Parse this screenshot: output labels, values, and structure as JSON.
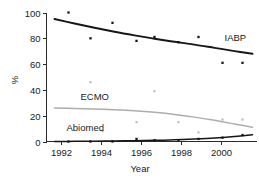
{
  "chart_data": {
    "type": "scatter",
    "title": "",
    "xlabel": "Year",
    "ylabel": "%",
    "xlim": [
      1991.3,
      2001.8
    ],
    "ylim": [
      0,
      100
    ],
    "xticks": [
      1992,
      1994,
      1996,
      1998,
      2000
    ],
    "yticks": [
      0,
      20,
      40,
      60,
      80,
      100
    ],
    "grid": false,
    "legend_position": "inline-annotation",
    "series": [
      {
        "name": "IABP",
        "color": "#161616",
        "marker": "square",
        "x": [
          1992.4,
          1993.5,
          1994.6,
          1995.8,
          1996.7,
          1997.9,
          1998.9,
          2000.1,
          2001.1
        ],
        "values": [
          100,
          80,
          92,
          78,
          81,
          77,
          81,
          61,
          61
        ],
        "fit_x": [
          1991.7,
          1992.7,
          1993.7,
          1994.7,
          1995.7,
          1996.7,
          1997.7,
          1998.7,
          1999.7,
          2000.7,
          2001.6
        ],
        "fit_values": [
          95,
          91.5,
          88.2,
          85.1,
          82.3,
          79.7,
          77.3,
          75.1,
          72.6,
          70.1,
          68
        ]
      },
      {
        "name": "ECMO",
        "color": "#b4b4b4",
        "marker": "square",
        "x": [
          1993.5,
          1994.1,
          1995.8,
          1996.7,
          1997.9,
          1998.9,
          2000.1,
          2001.1
        ],
        "values": [
          46,
          8,
          15,
          39,
          15,
          7,
          17,
          17
        ],
        "fit_x": [
          1991.7,
          1992.7,
          1993.7,
          1994.7,
          1995.7,
          1996.7,
          1997.7,
          1998.7,
          1999.7,
          2000.7,
          2001.6
        ],
        "fit_values": [
          26,
          25.6,
          25.2,
          24.6,
          23.8,
          22.6,
          21,
          18.9,
          16.4,
          13.6,
          11
        ]
      },
      {
        "name": "Abiomed",
        "color": "#161616",
        "marker": "square",
        "x": [
          1992.4,
          1993.5,
          1994.6,
          1995.8,
          1996.7,
          1997.9,
          1998.9,
          2000.1,
          2001.1
        ],
        "values": [
          0,
          0,
          0,
          2,
          1,
          1,
          2,
          3,
          5
        ],
        "fit_x": [
          1991.7,
          1992.7,
          1993.7,
          1994.7,
          1995.7,
          1996.7,
          1997.7,
          1998.7,
          1999.7,
          2000.7,
          2001.6
        ],
        "fit_values": [
          0,
          0.1,
          0.2,
          0.4,
          0.6,
          0.9,
          1.3,
          1.9,
          2.7,
          3.9,
          5.2
        ]
      }
    ],
    "annotations": [
      {
        "text": "IABP",
        "x": 2000.2,
        "y": 78
      },
      {
        "text": "ECMO",
        "x": 1993.0,
        "y": 32
      },
      {
        "text": "Abiomed",
        "x": 1992.3,
        "y": 8
      }
    ]
  }
}
